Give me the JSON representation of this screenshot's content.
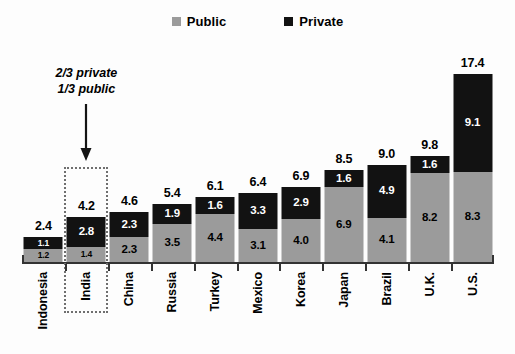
{
  "legend": {
    "items": [
      {
        "label": "Public",
        "color": "#9b9b9b",
        "key": "public"
      },
      {
        "label": "Private",
        "color": "#121212",
        "key": "private"
      }
    ]
  },
  "annotation": {
    "line1": "2/3 private",
    "line2": "1/3 public",
    "points_to": "India"
  },
  "highlight": {
    "category": "India"
  },
  "chart_data": {
    "type": "bar",
    "subtype": "stacked-bar",
    "title": "",
    "subtitle": "",
    "xlabel": "",
    "ylabel": "",
    "ylim": [
      0,
      17.4
    ],
    "grid": false,
    "legend_position": "top-center",
    "stack_order": [
      "public",
      "private"
    ],
    "categories": [
      "Indonesia",
      "India",
      "China",
      "Russia",
      "Turkey",
      "Mexico",
      "Korea",
      "Japan",
      "Brazil",
      "U.K.",
      "U.S."
    ],
    "series": [
      {
        "name": "Public",
        "color": "#9b9b9b",
        "values": [
          1.2,
          1.4,
          2.3,
          3.5,
          4.4,
          3.1,
          4.0,
          6.9,
          4.1,
          8.2,
          8.3
        ]
      },
      {
        "name": "Private",
        "color": "#121212",
        "values": [
          1.1,
          2.8,
          2.3,
          1.9,
          1.6,
          3.3,
          2.9,
          1.6,
          4.9,
          1.6,
          9.1
        ]
      }
    ],
    "totals": [
      2.4,
      4.2,
      4.6,
      5.4,
      6.1,
      6.4,
      6.9,
      8.5,
      9.0,
      9.8,
      17.4
    ],
    "bars": [
      {
        "category": "Indonesia",
        "public": "1.2",
        "private": "1.1",
        "total": "2.4"
      },
      {
        "category": "India",
        "public": "1.4",
        "private": "2.8",
        "total": "4.2"
      },
      {
        "category": "China",
        "public": "2.3",
        "private": "2.3",
        "total": "4.6"
      },
      {
        "category": "Russia",
        "public": "3.5",
        "private": "1.9",
        "total": "5.4"
      },
      {
        "category": "Turkey",
        "public": "4.4",
        "private": "1.6",
        "total": "6.1"
      },
      {
        "category": "Mexico",
        "public": "3.1",
        "private": "3.3",
        "total": "6.4"
      },
      {
        "category": "Korea",
        "public": "4.0",
        "private": "2.9",
        "total": "6.9"
      },
      {
        "category": "Japan",
        "public": "6.9",
        "private": "1.6",
        "total": "8.5"
      },
      {
        "category": "Brazil",
        "public": "4.1",
        "private": "4.9",
        "total": "9.0"
      },
      {
        "category": "U.K.",
        "public": "8.2",
        "private": "1.6",
        "total": "9.8"
      },
      {
        "category": "U.S.",
        "public": "8.3",
        "private": "9.1",
        "total": "17.4"
      }
    ]
  }
}
